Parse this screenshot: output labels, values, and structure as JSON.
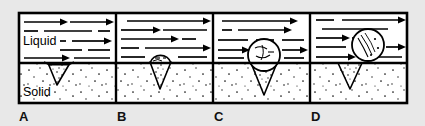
{
  "figure": {
    "background_color": "#e8e8e8",
    "ink_color": "#000000",
    "liquid_fill": "#ffffff",
    "solid_fill": "#ffffff",
    "frame": {
      "x": 18,
      "y": 12,
      "width": 390,
      "height": 92,
      "stroke_width": 2.5
    },
    "interface_y": 63
  },
  "labels": {
    "liquid": "Liquid",
    "solid": "Solid"
  },
  "panels": [
    {
      "id": "panel-a",
      "letter": "A",
      "x": 18,
      "width": 98,
      "bubble": "none",
      "cavity": {
        "type": "conical-pit",
        "mouth_width": 22,
        "depth": 22
      },
      "description": "Gas trapped in conical cavity, no bubble above surface",
      "arrow_rows": [
        {
          "y": 22,
          "segments": [
            {
              "x1": 24,
              "x2": 64,
              "arrow": true
            },
            {
              "x1": 70,
              "x2": 110,
              "arrow": true
            }
          ]
        },
        {
          "y": 31,
          "segments": [
            {
              "x1": 24,
              "x2": 38,
              "arrow": false
            },
            {
              "x1": 44,
              "x2": 92,
              "arrow": false
            },
            {
              "x1": 98,
              "x2": 110,
              "arrow": false
            }
          ]
        },
        {
          "y": 41,
          "segments": [
            {
              "x1": 62,
              "x2": 66,
              "arrow": false
            },
            {
              "x1": 72,
              "x2": 110,
              "arrow": true
            }
          ]
        },
        {
          "y": 50,
          "segments": [
            {
              "x1": 60,
              "x2": 82,
              "arrow": false
            },
            {
              "x1": 88,
              "x2": 110,
              "arrow": false
            }
          ]
        },
        {
          "y": 58,
          "segments": [
            {
              "x1": 24,
              "x2": 66,
              "arrow": true
            },
            {
              "x1": 74,
              "x2": 110,
              "arrow": false
            }
          ]
        }
      ]
    },
    {
      "id": "panel-b",
      "letter": "B",
      "x": 116,
      "width": 97,
      "bubble": {
        "cx": 160,
        "cy": 60,
        "r": 11,
        "state": "emerging"
      },
      "cavity": {
        "type": "conical-pit",
        "mouth_width": 22,
        "depth": 26
      },
      "description": "Small bubble emerging from the cavity mouth",
      "arrow_rows": [
        {
          "y": 21,
          "segments": [
            {
              "x1": 127,
              "x2": 207,
              "arrow": true
            }
          ]
        },
        {
          "y": 30,
          "segments": [
            {
              "x1": 121,
              "x2": 157,
              "arrow": true
            },
            {
              "x1": 163,
              "x2": 207,
              "arrow": false
            }
          ]
        },
        {
          "y": 39,
          "segments": [
            {
              "x1": 121,
              "x2": 175,
              "arrow": true
            },
            {
              "x1": 182,
              "x2": 196,
              "arrow": false
            }
          ]
        },
        {
          "y": 48,
          "segments": [
            {
              "x1": 121,
              "x2": 139,
              "arrow": false
            },
            {
              "x1": 145,
              "x2": 207,
              "arrow": true
            }
          ]
        },
        {
          "y": 57,
          "segments": [
            {
              "x1": 121,
              "x2": 145,
              "arrow": false
            },
            {
              "x1": 178,
              "x2": 207,
              "arrow": false
            }
          ]
        }
      ]
    },
    {
      "id": "panel-c",
      "letter": "C",
      "x": 213,
      "width": 97,
      "bubble": {
        "cx": 264,
        "cy": 55,
        "r": 16,
        "state": "growing"
      },
      "cavity": {
        "type": "conical-pit",
        "mouth_width": 26,
        "depth": 30
      },
      "description": "Bubble grown larger, still attached to the cavity",
      "arrow_rows": [
        {
          "y": 21,
          "segments": [
            {
              "x1": 222,
              "x2": 294,
              "arrow": true
            }
          ]
        },
        {
          "y": 30,
          "segments": [
            {
              "x1": 222,
              "x2": 232,
              "arrow": false
            },
            {
              "x1": 238,
              "x2": 288,
              "arrow": true
            }
          ]
        },
        {
          "y": 40,
          "segments": [
            {
              "x1": 218,
              "x2": 252,
              "arrow": false
            },
            {
              "x1": 258,
              "x2": 276,
              "arrow": false
            },
            {
              "x1": 282,
              "x2": 304,
              "arrow": false
            }
          ]
        },
        {
          "y": 50,
          "segments": [
            {
              "x1": 218,
              "x2": 246,
              "arrow": true
            },
            {
              "x1": 282,
              "x2": 304,
              "arrow": true
            }
          ]
        },
        {
          "y": 58,
          "segments": [
            {
              "x1": 218,
              "x2": 244,
              "arrow": false
            },
            {
              "x1": 284,
              "x2": 304,
              "arrow": false
            }
          ]
        }
      ]
    },
    {
      "id": "panel-d",
      "letter": "D",
      "x": 310,
      "width": 98,
      "bubble": {
        "cx": 368,
        "cy": 45,
        "r": 16,
        "state": "detached"
      },
      "cavity": {
        "type": "conical-pit",
        "mouth_width": 24,
        "depth": 26
      },
      "description": "Bubble detached and carried away by the liquid flow",
      "arrow_rows": [
        {
          "y": 20,
          "segments": [
            {
              "x1": 316,
              "x2": 334,
              "arrow": false
            },
            {
              "x1": 342,
              "x2": 402,
              "arrow": true
            }
          ]
        },
        {
          "y": 29,
          "segments": [
            {
              "x1": 322,
              "x2": 388,
              "arrow": false
            }
          ]
        },
        {
          "y": 38,
          "segments": [
            {
              "x1": 316,
              "x2": 346,
              "arrow": true
            },
            {
              "x1": 352,
              "x2": 360,
              "arrow": false
            }
          ]
        },
        {
          "y": 47,
          "segments": [
            {
              "x1": 316,
              "x2": 346,
              "arrow": false
            },
            {
              "x1": 388,
              "x2": 402,
              "arrow": true
            }
          ]
        },
        {
          "y": 57,
          "segments": [
            {
              "x1": 316,
              "x2": 352,
              "arrow": true
            },
            {
              "x1": 360,
              "x2": 402,
              "arrow": false
            }
          ]
        }
      ]
    }
  ]
}
